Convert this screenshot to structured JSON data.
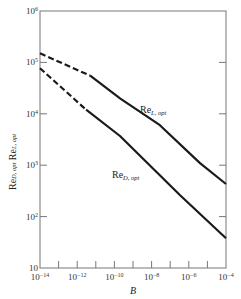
{
  "chart_data": {
    "type": "line",
    "title": "",
    "xlabel": "B",
    "ylabel": "Re_D,opt   Re_L,opt",
    "ylabel_parts": [
      "Re",
      "D, opt",
      "Re",
      "L, opt"
    ],
    "xscale": "log",
    "yscale": "log",
    "xlim": [
      1e-14,
      0.0001
    ],
    "ylim": [
      10,
      1000000.0
    ],
    "grid": false,
    "legend": "inline curve labels",
    "x_ticks": [
      "10^-14",
      "10^-12",
      "10^-10",
      "10^-8",
      "10^-6",
      "10^-4"
    ],
    "x_tick_labels": [
      {
        "base": "10",
        "exp": "−14"
      },
      {
        "base": "10",
        "exp": "−12"
      },
      {
        "base": "10",
        "exp": "−10"
      },
      {
        "base": "10",
        "exp": "−8"
      },
      {
        "base": "10",
        "exp": "−6"
      },
      {
        "base": "10",
        "exp": "−4"
      }
    ],
    "y_ticks": [
      "10",
      "10^2",
      "10^3",
      "10^4",
      "10^5",
      "10^6"
    ],
    "y_tick_labels": [
      {
        "base": "10",
        "exp": ""
      },
      {
        "base": "10",
        "exp": "2"
      },
      {
        "base": "10",
        "exp": "3"
      },
      {
        "base": "10",
        "exp": "4"
      },
      {
        "base": "10",
        "exp": "5"
      },
      {
        "base": "10",
        "exp": "6"
      }
    ],
    "series": [
      {
        "name": "Re_L,opt",
        "label_main": "Re",
        "label_sub": "L, opt",
        "style": "solid, dashed for B < ~1e-11",
        "dashed_until_B": 5e-12,
        "points": [
          {
            "B": 1e-14,
            "Re": 150000
          },
          {
            "B": 5e-12,
            "Re": 55000
          },
          {
            "B": 2e-10,
            "Re": 20000
          },
          {
            "B": 2.8e-08,
            "Re": 6000
          },
          {
            "B": 4e-06,
            "Re": 1100
          },
          {
            "B": 0.0001,
            "Re": 430
          }
        ]
      },
      {
        "name": "Re_D,opt",
        "label_main": "Re",
        "label_sub": "D, opt",
        "style": "solid, dashed for B < ~1e-11",
        "dashed_until_B": 3e-12,
        "points": [
          {
            "B": 1e-14,
            "Re": 77000
          },
          {
            "B": 3e-12,
            "Re": 12000
          },
          {
            "B": 2e-10,
            "Re": 3700
          },
          {
            "B": 3.4e-07,
            "Re": 260
          },
          {
            "B": 0.0001,
            "Re": 38
          }
        ]
      }
    ]
  },
  "colors": {
    "line": "#1a1a1a",
    "axis": "#777777",
    "text": "#2a2a2a"
  }
}
